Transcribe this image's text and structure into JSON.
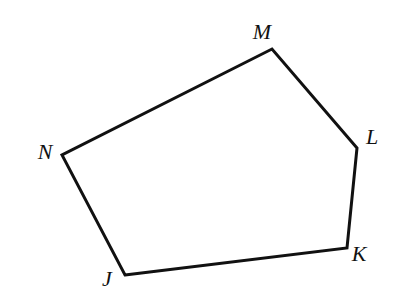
{
  "figure": {
    "kind": "geometry-diagram",
    "shape_name": "pentagon JKLMN",
    "background_color": "#ffffff",
    "stroke_color": "#111111",
    "stroke_width": 3,
    "label_color": "#111111",
    "label_font_size": 22,
    "canvas": {
      "width": 403,
      "height": 303
    },
    "vertices": [
      {
        "id": "J",
        "label": "J",
        "x": 125,
        "y": 275,
        "label_x": 107,
        "label_y": 279
      },
      {
        "id": "K",
        "label": "K",
        "x": 347,
        "y": 248,
        "label_x": 359,
        "label_y": 254
      },
      {
        "id": "L",
        "label": "L",
        "x": 357,
        "y": 148,
        "label_x": 372,
        "label_y": 137
      },
      {
        "id": "M",
        "label": "M",
        "x": 272,
        "y": 49,
        "label_x": 262,
        "label_y": 32
      },
      {
        "id": "N",
        "label": "N",
        "x": 62,
        "y": 155,
        "label_x": 45,
        "label_y": 152
      }
    ],
    "edges": [
      {
        "from": "J",
        "to": "K"
      },
      {
        "from": "K",
        "to": "L"
      },
      {
        "from": "L",
        "to": "M"
      },
      {
        "from": "M",
        "to": "N"
      },
      {
        "from": "N",
        "to": "J"
      }
    ],
    "polygon_points": "125,275 347,248 357,148 272,49 62,155"
  }
}
